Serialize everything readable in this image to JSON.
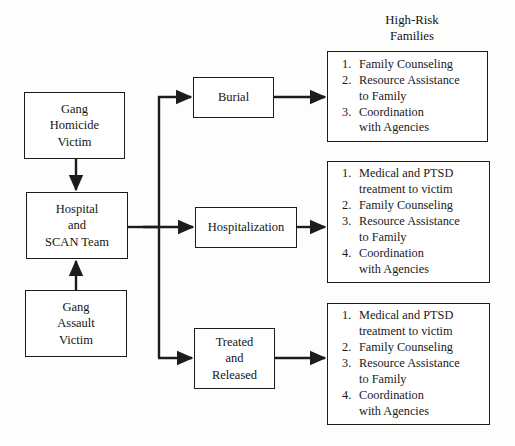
{
  "diagram": {
    "title_caption": {
      "line1": "High-Risk",
      "line2": "Families"
    },
    "intake_nodes": [
      {
        "id": "gang-homicide-victim",
        "line1": "Gang",
        "line2": "Homicide",
        "line3": "Victim"
      },
      {
        "id": "hospital-and-scan-team",
        "line1": "Hospital",
        "line2": "and",
        "line3": "SCAN Team"
      },
      {
        "id": "gang-assault-victim",
        "line1": "Gang",
        "line2": "Assault",
        "line3": "Victim"
      }
    ],
    "outcome_nodes": [
      {
        "id": "burial",
        "line1": "Burial",
        "line2": "",
        "line3": ""
      },
      {
        "id": "hospitalization",
        "line1": "Hospitalization",
        "line2": "",
        "line3": ""
      },
      {
        "id": "treated-and-released",
        "line1": "Treated",
        "line2": "and",
        "line3": "Released"
      }
    ],
    "service_lists": [
      {
        "id": "burial-services",
        "items": [
          {
            "num": "1.",
            "line1": "Family Counseling",
            "line2": ""
          },
          {
            "num": "2.",
            "line1": "Resource Assistance",
            "line2": "to Family"
          },
          {
            "num": "3.",
            "line1": "Coordination",
            "line2": "with Agencies"
          }
        ]
      },
      {
        "id": "hospitalization-services",
        "items": [
          {
            "num": "1.",
            "line1": "Medical and PTSD",
            "line2": "treatment to victim"
          },
          {
            "num": "2.",
            "line1": "Family Counseling",
            "line2": ""
          },
          {
            "num": "3.",
            "line1": "Resource Assistance",
            "line2": "to Family"
          },
          {
            "num": "4.",
            "line1": "Coordination",
            "line2": "with Agencies"
          }
        ]
      },
      {
        "id": "treated-released-services",
        "items": [
          {
            "num": "1.",
            "line1": "Medical and PTSD",
            "line2": "treatment to victim"
          },
          {
            "num": "2.",
            "line1": "Family Counseling",
            "line2": ""
          },
          {
            "num": "3.",
            "line1": "Resource Assistance",
            "line2": "to Family"
          },
          {
            "num": "4.",
            "line1": "Coordination",
            "line2": "with Agencies"
          }
        ]
      }
    ],
    "colors": {
      "stroke": "#1c1c1c",
      "box_fill": "#ffffff",
      "page_background": "#fdfdfc",
      "text": "#141414"
    }
  }
}
